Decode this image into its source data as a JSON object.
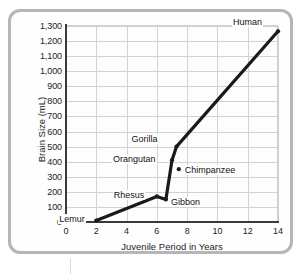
{
  "figure": {
    "frame_color": "#b6b6b6",
    "background": "#fefefe"
  },
  "chart_data": {
    "type": "line",
    "title": "",
    "xlabel": "Juvenile Period in Years",
    "ylabel": "Brain Size (mL)",
    "xlim": [
      0,
      14
    ],
    "ylim": [
      0,
      1300
    ],
    "xticks": [
      "0",
      "2",
      "4",
      "6",
      "8",
      "10",
      "12",
      "14"
    ],
    "yticks": [
      "0",
      "100",
      "200",
      "300",
      "400",
      "500",
      "600",
      "700",
      "800",
      "900",
      "1,000",
      "1,100",
      "1,200",
      "1,300"
    ],
    "grid": true,
    "legend": "none",
    "line_color": "#1a1a1a",
    "marker_color": "#1a1a1a",
    "x": [
      2,
      6,
      6.6,
      7,
      7.3,
      14
    ],
    "values": [
      10,
      170,
      150,
      410,
      500,
      1265
    ],
    "points": [
      {
        "label": "Lemur",
        "x": 2,
        "y": 10,
        "label_dx": -38,
        "label_dy": -6
      },
      {
        "label": "Rhesus",
        "x": 6,
        "y": 170,
        "label_dx": -44,
        "label_dy": -6
      },
      {
        "label": "Gibbon",
        "x": 6.6,
        "y": 150,
        "label_dx": 4,
        "label_dy": -2
      },
      {
        "label": "Orangutan",
        "x": 7,
        "y": 410,
        "label_dx": -60,
        "label_dy": -6
      },
      {
        "label": "Gorilla",
        "x": 7.3,
        "y": 500,
        "label_dx": -46,
        "label_dy": -13
      },
      {
        "label": "Chimpanzee",
        "x": 7.45,
        "y": 350,
        "label_dx": 5,
        "label_dy": -4
      },
      {
        "label": "Human",
        "x": 14,
        "y": 1265,
        "label_dx": -46,
        "label_dy": -14
      }
    ]
  }
}
